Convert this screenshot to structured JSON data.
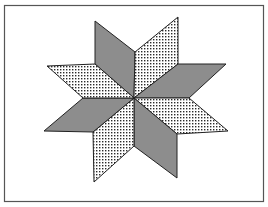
{
  "figure": {
    "frame": {
      "x": 4,
      "y": 5,
      "width": 260,
      "height": 197,
      "stroke": "#555555"
    },
    "center": [
      134,
      98
    ],
    "colors": {
      "gray": "#8d8d8d",
      "outline": "#222222",
      "dot": "#2a2a2a",
      "background": "#ffffff"
    },
    "pieces": [
      {
        "name": "rhombus-top-left",
        "fill": "gray",
        "points": "134,98 135,52 95,21 95,64"
      },
      {
        "name": "rhombus-top-right",
        "fill": "dotted",
        "points": "134,98 178,64 178,17 135,52"
      },
      {
        "name": "rhombus-right-upper",
        "fill": "gray",
        "points": "134,98 189,98 226,64 178,64"
      },
      {
        "name": "rhombus-right-lower",
        "fill": "dotted",
        "points": "134,98 177,134 228,131 189,98"
      },
      {
        "name": "rhombus-bottom-right",
        "fill": "gray",
        "points": "134,98 134,146 177,178 177,134"
      },
      {
        "name": "rhombus-bottom-left",
        "fill": "dotted",
        "points": "134,98 93,132 94,182 134,146"
      },
      {
        "name": "rhombus-left-lower",
        "fill": "gray",
        "points": "134,98 83,98 44,131 93,132"
      },
      {
        "name": "rhombus-left-upper",
        "fill": "dotted",
        "points": "134,98 95,64 47,66 83,98"
      }
    ]
  }
}
